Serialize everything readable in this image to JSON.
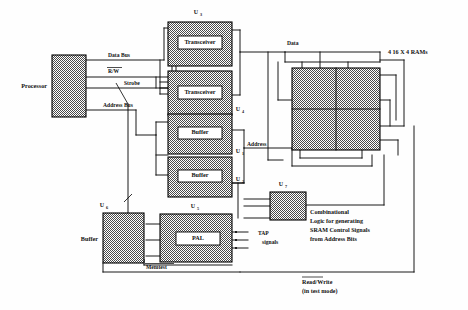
{
  "figure": {
    "background_color": "#ffffff",
    "line_color": "#000000",
    "block_fill": "checkerboard-hatch"
  },
  "blocks": {
    "processor": {
      "label": "Processor",
      "ref": ""
    },
    "transceiver1": {
      "label": "Transceiver",
      "ref": "U",
      "ref_sub": "3"
    },
    "transceiver2": {
      "label": "Transceiver",
      "ref": "U",
      "ref_sub": "4"
    },
    "buffer1": {
      "label": "Buffer",
      "ref": "U",
      "ref_sub": "1"
    },
    "buffer2": {
      "label": "Buffer",
      "ref": "U",
      "ref_sub": "2"
    },
    "rams": {
      "label": "4  16 X 4  RAMs",
      "cells": 4
    },
    "comb_logic": {
      "label": "",
      "ref": "U",
      "ref_sub": "7"
    },
    "pal": {
      "label": "PAL",
      "ref": "U",
      "ref_sub": "5"
    },
    "buffer3": {
      "label": "Buffer",
      "ref": "U",
      "ref_sub": "6"
    }
  },
  "wire_labels": {
    "data_bus": "Data Bus",
    "rw": "R/W",
    "strobe": "Strobe",
    "address_bus": "Address Bus",
    "data": "Data",
    "address": "Address",
    "memtest": "Memtest",
    "tap_line1": "TAP",
    "tap_line2": "signals"
  },
  "notes": {
    "comb_logic_line1": "Combinational",
    "comb_logic_line2": "Logic  for generating",
    "comb_logic_line3": "SRAM  Control Signals",
    "comb_logic_line4": "from  Address  Bits",
    "readwrite_line1": "Read/Write",
    "readwrite_line2": "(in  test  mode)"
  }
}
